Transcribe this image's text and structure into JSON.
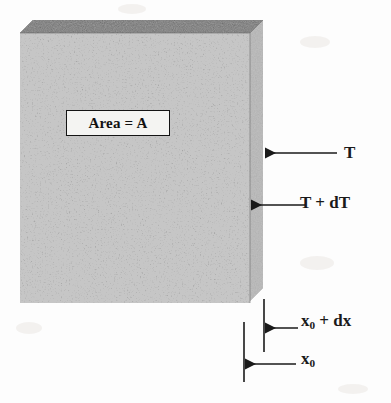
{
  "figure": {
    "kind": "thermal-conduction-slab-diagram",
    "labels": {
      "area": "Area = A",
      "temperature_hot": "T",
      "temperature_cold_prefix": "T + dT",
      "temperature_cold_main": "T + dT",
      "position_outer_value": "x",
      "position_outer_subscript": "0",
      "position_outer_suffix": " + dx",
      "position_inner_value": "x",
      "position_inner_subscript": "0"
    },
    "annotations": [
      {
        "name": "arrow-T",
        "label": "T",
        "direction": "left",
        "target": "slab-right-face"
      },
      {
        "name": "arrow-T-plus-dT",
        "label": "T + dT",
        "direction": "left",
        "target": "slab-front-right-edge"
      },
      {
        "name": "arrow-x0-plus-dx",
        "label": "x0 + dx",
        "direction": "left",
        "target": "dimension-tick-inner"
      },
      {
        "name": "arrow-x0",
        "label": "x0",
        "direction": "left",
        "target": "dimension-tick-outer"
      }
    ],
    "colors": {
      "page_background": "#fdfdfd",
      "slab_top_face": "#5e5e5e",
      "slab_right_face": "#a8a8a8",
      "slab_front_face_mean": "#909090",
      "ink": "#1a1a1a",
      "callout_fill": "#f4f4f2",
      "callout_border": "#141414"
    },
    "geometry": {
      "front_face": {
        "x": 20,
        "y": 33,
        "width": 230,
        "height": 270
      },
      "depth_offset": {
        "dx": 13,
        "dy": -13
      },
      "dimension_tick_inner_x": 264,
      "dimension_tick_outer_x": 244
    }
  }
}
